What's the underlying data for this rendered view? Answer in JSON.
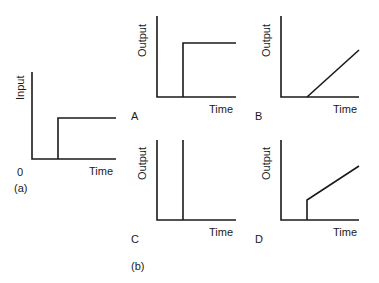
{
  "figure": {
    "input_panel": {
      "tag": "(a)",
      "ylabel": "Input",
      "xlabel": "Time",
      "origin_label": "0",
      "signal": "step"
    },
    "output_group": {
      "tag": "(b)",
      "panels": [
        {
          "letter": "A",
          "ylabel": "Output",
          "xlabel": "Time",
          "signal": "step"
        },
        {
          "letter": "B",
          "ylabel": "Output",
          "xlabel": "Time",
          "signal": "ramp"
        },
        {
          "letter": "C",
          "ylabel": "Output",
          "xlabel": "Time",
          "signal": "impulse"
        },
        {
          "letter": "D",
          "ylabel": "Output",
          "xlabel": "Time",
          "signal": "step-plus-ramp"
        }
      ]
    }
  },
  "colors": {
    "line": "#1a1a1a",
    "background": "#ffffff"
  }
}
